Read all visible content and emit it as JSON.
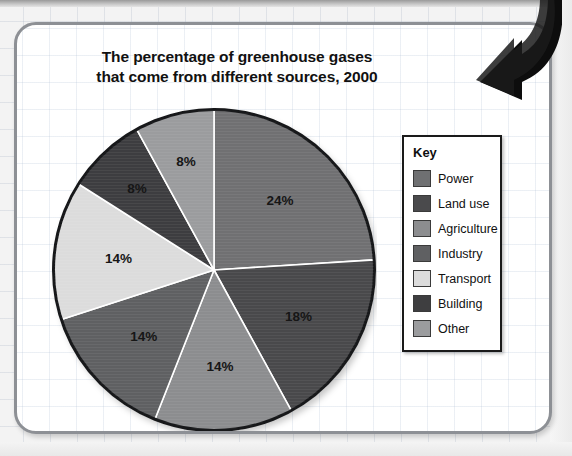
{
  "chart_data": {
    "type": "pie",
    "title": "The percentage of greenhouse gases that come from different sources, 2000",
    "title_line1": "The percentage of greenhouse gases",
    "title_line2": "that come from different sources, 2000",
    "unit": "%",
    "legend_position": "right",
    "legend_title": "Key",
    "start_angle_deg": 0,
    "direction": "clockwise",
    "categories": [
      "Power",
      "Land use",
      "Agriculture",
      "Industry",
      "Transport",
      "Building",
      "Other"
    ],
    "values": [
      24,
      18,
      14,
      14,
      14,
      8,
      8
    ],
    "labels": [
      "24%",
      "18%",
      "14%",
      "14%",
      "14%",
      "8%",
      "8%"
    ],
    "colors": [
      "#6f7072",
      "#4a4a4c",
      "#8c8d8f",
      "#5f6062",
      "#dcdcdc",
      "#3e3e40",
      "#9b9c9e"
    ],
    "slices": [
      {
        "name": "Power",
        "value": 24,
        "label": "24%",
        "color": "#6f7072"
      },
      {
        "name": "Land use",
        "value": 18,
        "label": "18%",
        "color": "#4a4a4c"
      },
      {
        "name": "Agriculture",
        "value": 14,
        "label": "14%",
        "color": "#8c8d8f"
      },
      {
        "name": "Industry",
        "value": 14,
        "label": "14%",
        "color": "#5f6062"
      },
      {
        "name": "Transport",
        "value": 14,
        "label": "14%",
        "color": "#dcdcdc"
      },
      {
        "name": "Building",
        "value": 8,
        "label": "8%",
        "color": "#3e3e40"
      },
      {
        "name": "Other",
        "value": 8,
        "label": "8%",
        "color": "#9b9c9e"
      }
    ],
    "legend_entries": [
      {
        "label": "Power",
        "color": "#6f7072"
      },
      {
        "label": "Land use",
        "color": "#4a4a4c"
      },
      {
        "label": "Agriculture",
        "color": "#8c8d8f"
      },
      {
        "label": "Industry",
        "color": "#5f6062"
      },
      {
        "label": "Transport",
        "color": "#dcdcdc"
      },
      {
        "label": "Building",
        "color": "#3e3e40"
      },
      {
        "label": "Other",
        "color": "#9b9c9e"
      }
    ],
    "xlabel": "",
    "ylabel": "",
    "grid": true
  },
  "decorations": {
    "arrow_icon": "curved-down-arrow-icon",
    "arrow_color": "#101010"
  },
  "card": {
    "border_color": "#8d9095",
    "background_color": "#ffffff",
    "grid_color": "#b4c3d7"
  }
}
